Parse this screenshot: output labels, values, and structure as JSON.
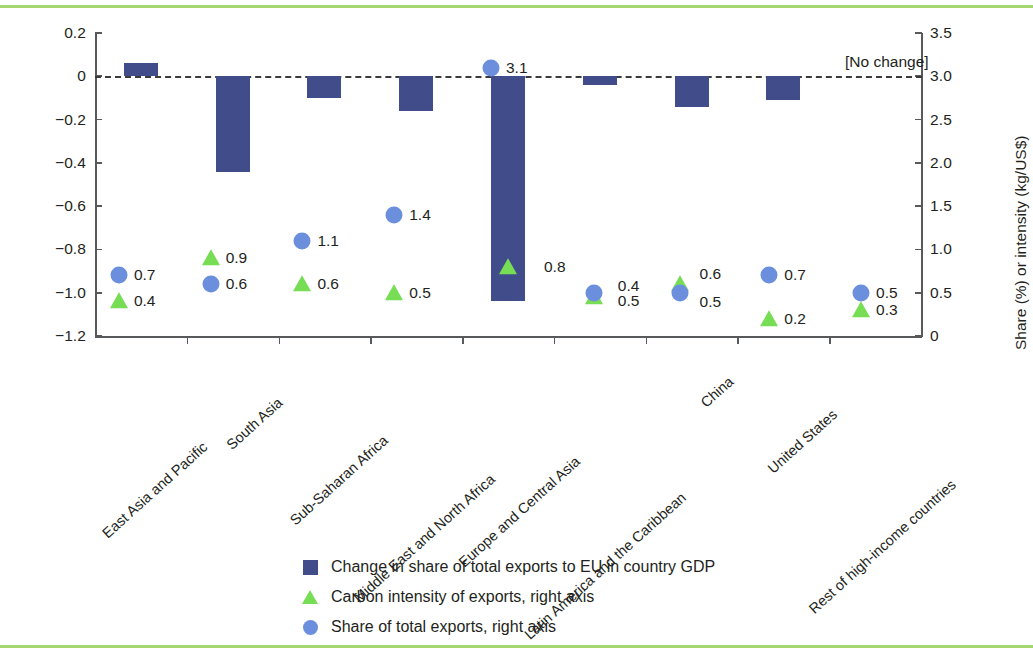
{
  "chart_data": {
    "type": "bar",
    "title": "",
    "subtitle": "",
    "categories": [
      "East Asia and Pacific",
      "South Asia",
      "Sub-Saharan Africa",
      "Middle East and North Africa",
      "Europe and Central Asia",
      "Latin America and the Caribbean",
      "China",
      "United States",
      "Rest of high-income countries"
    ],
    "xlabel": "",
    "ylabel": "Change in total exports (%)",
    "y2label": "Share (%) or intensity (kg/US$)",
    "ylim": [
      -1.2,
      0.2
    ],
    "y2lim": [
      0,
      3.5
    ],
    "yticks": [
      "0.2",
      "0",
      "−0.2",
      "−0.4",
      "−0.6",
      "−0.8",
      "−1.0",
      "−1.2"
    ],
    "ytick_values": [
      0.2,
      0,
      -0.2,
      -0.4,
      -0.6,
      -0.8,
      -1.0,
      -1.2
    ],
    "y2ticks": [
      "3.5",
      "3.0",
      "2.5",
      "2.0",
      "1.5",
      "1.0",
      "0.5",
      "0"
    ],
    "y2tick_values": [
      3.5,
      3.0,
      2.5,
      2.0,
      1.5,
      1.0,
      0.5,
      0
    ],
    "grid": false,
    "legend_position": "bottom",
    "zero_annotation": "[No change]",
    "series": [
      {
        "name": "Change in share of total exports to EU in country GDP",
        "type": "bar",
        "axis": "left",
        "color": "#414c8b",
        "values": [
          0.06,
          -0.44,
          -0.1,
          -0.16,
          -1.04,
          -0.04,
          -0.14,
          -0.11,
          0.0
        ]
      },
      {
        "name": "Carbon intensity of exports, right axis",
        "type": "scatter-triangle",
        "axis": "right",
        "color": "#77dd55",
        "values": [
          0.4,
          0.9,
          0.6,
          0.5,
          0.8,
          0.4,
          0.6,
          0.2,
          0.3
        ],
        "labels": [
          "0.4",
          "0.9",
          "0.6",
          "0.5",
          "0.8",
          "0.4",
          "0.6",
          "0.2",
          "0.3"
        ]
      },
      {
        "name": "Share of total exports, right axis",
        "type": "scatter-circle",
        "axis": "right",
        "color": "#6b8fdd",
        "values": [
          0.7,
          0.6,
          1.1,
          1.4,
          3.1,
          0.5,
          0.5,
          0.7,
          0.5
        ],
        "labels": [
          "0.7",
          "0.6",
          "1.1",
          "1.4",
          "3.1",
          "0.5",
          "0.5",
          "0.7",
          "0.5"
        ]
      }
    ]
  },
  "legend": {
    "items": [
      {
        "marker": "square",
        "label": "Change in share of total exports to EU in country GDP"
      },
      {
        "marker": "triangle",
        "label": "Carbon intensity of exports, right axis"
      },
      {
        "marker": "circle",
        "label": "Share of total exports, right axis"
      }
    ]
  },
  "colors": {
    "bar": "#414c8b",
    "triangle": "#77dd55",
    "circle": "#6b8fdd",
    "rule": "#a5d66f",
    "axis": "#58595b",
    "text": "#231f20"
  }
}
